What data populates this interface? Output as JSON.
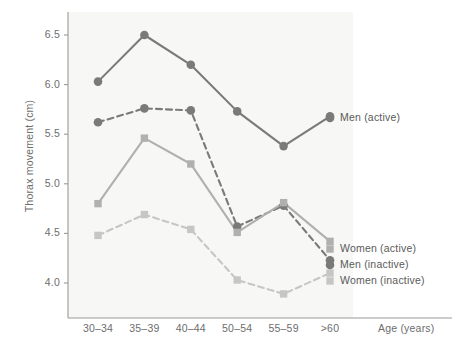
{
  "chart_data": {
    "type": "line",
    "title": "",
    "xlabel": "Age (years)",
    "ylabel": "Thorax movement (cm)",
    "categories": [
      "30–34",
      "35–39",
      "40–44",
      "50–54",
      "55–59",
      ">60"
    ],
    "ytick_labels": [
      "6.5",
      "6.0",
      "5.5",
      "5.0",
      "4.5",
      "4.0"
    ],
    "ytick_values": [
      6.5,
      6.0,
      5.5,
      5.0,
      4.5,
      4.0
    ],
    "ylim": [
      3.72,
      6.68
    ],
    "grid": false,
    "legend_position": "right-inline",
    "plot_background": "#f7f7f5",
    "series": [
      {
        "name": "Men (active)",
        "values": [
          6.03,
          6.5,
          6.2,
          5.73,
          5.38,
          5.68
        ],
        "color": "#7a7a7a",
        "marker": "circle",
        "linestyle": "solid"
      },
      {
        "name": "Men (inactive)",
        "values": [
          5.62,
          5.76,
          5.74,
          4.57,
          4.78,
          4.23
        ],
        "color": "#7a7a7a",
        "marker": "circle",
        "linestyle": "dashed"
      },
      {
        "name": "Women (active)",
        "values": [
          4.8,
          5.46,
          5.2,
          4.51,
          4.81,
          4.42
        ],
        "color": "#b0b0ae",
        "marker": "square",
        "linestyle": "solid"
      },
      {
        "name": "Women (inactive)",
        "values": [
          4.48,
          4.69,
          4.54,
          4.03,
          3.89,
          4.1
        ],
        "color": "#c6c6c4",
        "marker": "square",
        "linestyle": "dashed"
      }
    ],
    "legend_entries": [
      {
        "label": "Men (active)",
        "x": 340,
        "y": 118,
        "color": "#7a7a7a",
        "marker": "circle"
      },
      {
        "label": "Women (active)",
        "x": 340,
        "y": 249,
        "color": "#b0b0ae",
        "marker": "square"
      },
      {
        "label": "Men (inactive)",
        "x": 340,
        "y": 265,
        "color": "#7a7a7a",
        "marker": "circle"
      },
      {
        "label": "Women (inactive)",
        "x": 340,
        "y": 281,
        "color": "#c6c6c4",
        "marker": "square"
      }
    ]
  }
}
